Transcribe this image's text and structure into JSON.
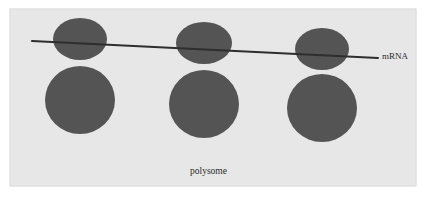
{
  "figure": {
    "name": "polysome-diagram",
    "caption": "polysome",
    "colors": {
      "page_background": "#ffffff",
      "panel_background": "#e7e7e7",
      "panel_border": "#d2d2d2",
      "ribosome_fill": "#545454",
      "mrna_stroke": "#2e2e2e",
      "label_text": "#2b2b2b"
    },
    "panel": {
      "x": 10,
      "y": 9,
      "width": 406,
      "height": 177
    }
  },
  "labels": {
    "mrna": "mRNA",
    "polysome": "polysome"
  },
  "mrna_strand": {
    "name": "mRNA",
    "x1": 32,
    "y1": 41,
    "x2": 378,
    "y2": 58,
    "stroke_width": 2.1
  },
  "ribosomes": [
    {
      "name": "ribosome-1",
      "small_subunit": {
        "cx": 80,
        "cy": 39,
        "rx": 27,
        "ry": 21
      },
      "large_subunit": {
        "cx": 80,
        "cy": 100,
        "rx": 35,
        "ry": 34
      }
    },
    {
      "name": "ribosome-2",
      "small_subunit": {
        "cx": 204,
        "cy": 43,
        "rx": 28,
        "ry": 21
      },
      "large_subunit": {
        "cx": 204,
        "cy": 104,
        "rx": 35,
        "ry": 34
      }
    },
    {
      "name": "ribosome-3",
      "small_subunit": {
        "cx": 322,
        "cy": 49,
        "rx": 27,
        "ry": 21
      },
      "large_subunit": {
        "cx": 322,
        "cy": 108,
        "rx": 35,
        "ry": 34
      }
    }
  ],
  "text_positions": {
    "mrna": {
      "x": 382,
      "y": 59,
      "font_size": 9
    },
    "polysome": {
      "x": 190,
      "y": 174,
      "font_size": 9.5
    }
  }
}
